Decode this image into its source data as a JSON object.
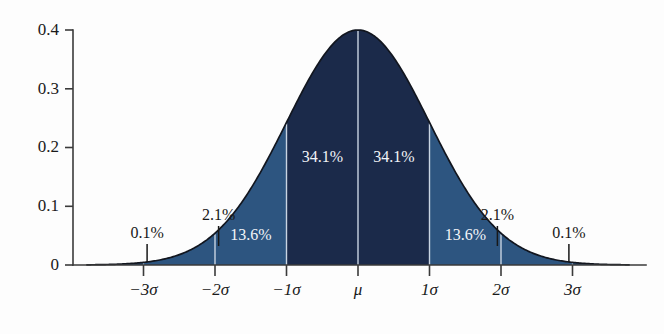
{
  "chart_data": {
    "type": "area",
    "title": "",
    "subtitle": "",
    "xlabel": "",
    "ylabel": "",
    "xlim": [
      -3.8,
      3.8
    ],
    "ylim": [
      0,
      0.4
    ],
    "grid": false,
    "legend": "none",
    "distribution": "standard normal probability density",
    "y_ticks": [
      "0",
      "0.1",
      "0.2",
      "0.3",
      "0.4"
    ],
    "y_tick_values": [
      0,
      0.1,
      0.2,
      0.3,
      0.4
    ],
    "x_ticks": [
      "−3σ",
      "−2σ",
      "−1σ",
      "μ",
      "1σ",
      "2σ",
      "3σ"
    ],
    "x_tick_values": [
      -3,
      -2,
      -1,
      0,
      1,
      2,
      3
    ],
    "peak_value": 0.4,
    "bands": [
      {
        "name": "minus3to-minus2",
        "label": "0.1%",
        "value": 0.1,
        "from": -3,
        "to": -2,
        "fill": "#2d5580",
        "label_color": "outside"
      },
      {
        "name": "minus2to-minus1",
        "label": "2.1%",
        "value": 2.1,
        "from": -2,
        "to": -1,
        "fill": "#2d5580",
        "label_color": "outside"
      },
      {
        "name": "minus1to-mu",
        "label": "13.6%",
        "value": 13.6,
        "from": -2,
        "to": -1,
        "fill": "#2d5580",
        "label_color": "inside"
      },
      {
        "name": "minus1sigma-to-mu",
        "label": "34.1%",
        "value": 34.1,
        "from": -1,
        "to": 0,
        "fill": "#1b2a4a",
        "label_color": "inside"
      },
      {
        "name": "mu-to-plus1sigma",
        "label": "34.1%",
        "value": 34.1,
        "from": 0,
        "to": 1,
        "fill": "#1b2a4a",
        "label_color": "inside"
      },
      {
        "name": "plus1to-plus2",
        "label": "13.6%",
        "value": 13.6,
        "from": 1,
        "to": 2,
        "fill": "#2d5580",
        "label_color": "inside"
      },
      {
        "name": "plus2to-plus3",
        "label": "2.1%",
        "value": 2.1,
        "from": 2,
        "to": 3,
        "fill": "#2d5580",
        "label_color": "outside"
      },
      {
        "name": "plus3-tail",
        "label": "0.1%",
        "value": 0.1,
        "from": 3,
        "to": 3.8,
        "fill": "#2d5580",
        "label_color": "outside"
      }
    ],
    "annotations": [
      {
        "text": "0.1%",
        "x": -2.95,
        "placement": "above-axis-left-tail"
      },
      {
        "text": "2.1%",
        "x": -1.95,
        "placement": "above-axis"
      },
      {
        "text": "13.6%",
        "x": -1.5,
        "placement": "inside-band"
      },
      {
        "text": "34.1%",
        "x": -0.5,
        "placement": "inside-band"
      },
      {
        "text": "34.1%",
        "x": 0.5,
        "placement": "inside-band"
      },
      {
        "text": "13.6%",
        "x": 1.5,
        "placement": "inside-band"
      },
      {
        "text": "2.1%",
        "x": 1.95,
        "placement": "above-axis"
      },
      {
        "text": "0.1%",
        "x": 2.95,
        "placement": "above-axis-right-tail"
      }
    ],
    "colors": {
      "core_fill": "#1b2a4a",
      "outer_fill": "#2d5580",
      "curve_stroke": "#12161f",
      "axis": "#3a3a3a",
      "background": "#fdfdfd",
      "inside_label": "#f2f4f8",
      "outside_label": "#181818",
      "divider": "#c9d4e2"
    }
  },
  "labels": {
    "y0": "0",
    "y1": "0.1",
    "y2": "0.2",
    "y3": "0.3",
    "y4": "0.4",
    "xm3": "−3σ",
    "xm2": "−2σ",
    "xm1": "−1σ",
    "xmu": "μ",
    "xp1": "1σ",
    "xp2": "2σ",
    "xp3": "3σ",
    "p_l3": "0.1%",
    "p_l2": "2.1%",
    "p_l1": "13.6%",
    "p_lc": "34.1%",
    "p_rc": "34.1%",
    "p_r1": "13.6%",
    "p_r2": "2.1%",
    "p_r3": "0.1%"
  }
}
